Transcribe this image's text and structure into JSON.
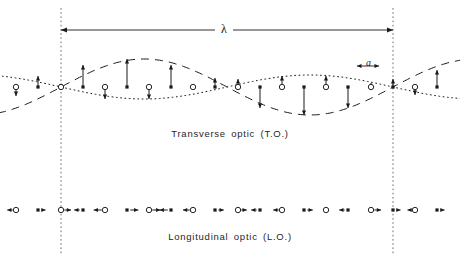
{
  "figure": {
    "title_top": "Transverse  optic  (T.O.)",
    "title_bottom": "Longitudinal  optic  (L.O.)",
    "wavelength_label": "λ",
    "lattice_label": "a",
    "colors": {
      "line": "#1a1a1a",
      "background": "#ffffff",
      "open_atom_stroke": "#1a1a1a",
      "filled_atom": "#1a1a1a"
    }
  },
  "chart_data": {
    "type": "line",
    "xlabel": "",
    "ylabel": "",
    "grid": false,
    "legend": "none",
    "annotations": [
      {
        "text": "λ",
        "meaning": "wavelength",
        "x_from": 61,
        "x_to": 393,
        "y": 30
      },
      {
        "text": "a",
        "meaning": "lattice spacing between like atoms",
        "x_from": 357,
        "x_to": 379,
        "y": 66
      },
      {
        "text": "Transverse  optic  (T.O.)",
        "y": 133
      },
      {
        "text": "Longitudinal  optic  (L.O.)",
        "y": 236
      }
    ],
    "axis_ranges": {
      "x": [
        0,
        460
      ],
      "y_transverse_baseline": 87,
      "y_longitudinal_baseline": 210
    },
    "wavelength_px": 332,
    "lattice_spacing_px": 22.1,
    "amplitude_px": 28,
    "series": [
      {
        "name": "dashed envelope (filled atoms, transverse)",
        "style": "dashed",
        "phase_deg": 0,
        "amplitude": 28,
        "description": "cos-like envelope traced by displaced filled atoms"
      },
      {
        "name": "dotted envelope (open atoms, transverse)",
        "style": "dotted",
        "phase_deg": 180,
        "amplitude": 12,
        "description": "anti-phase envelope traced by displaced open atoms"
      }
    ],
    "transverse_atoms": [
      {
        "x": 16,
        "type": "open",
        "disp": -9
      },
      {
        "x": 38,
        "type": "filled",
        "disp": 11
      },
      {
        "x": 61,
        "type": "open",
        "disp": -2
      },
      {
        "x": 83,
        "type": "filled",
        "disp": 22
      },
      {
        "x": 105,
        "type": "open",
        "disp": -12
      },
      {
        "x": 127,
        "type": "filled",
        "disp": 28
      },
      {
        "x": 149,
        "type": "open",
        "disp": -12
      },
      {
        "x": 171,
        "type": "filled",
        "disp": 22
      },
      {
        "x": 193,
        "type": "open",
        "disp": -3
      },
      {
        "x": 215,
        "type": "filled",
        "disp": 9
      },
      {
        "x": 238,
        "type": "open",
        "disp": 8
      },
      {
        "x": 260,
        "type": "filled",
        "disp": -21
      },
      {
        "x": 282,
        "type": "open",
        "disp": 11
      },
      {
        "x": 304,
        "type": "filled",
        "disp": -28
      },
      {
        "x": 326,
        "type": "open",
        "disp": 11
      },
      {
        "x": 348,
        "type": "filled",
        "disp": -21
      },
      {
        "x": 371,
        "type": "open",
        "disp": 4
      },
      {
        "x": 393,
        "type": "filled",
        "disp": 8
      },
      {
        "x": 415,
        "type": "open",
        "disp": -8
      },
      {
        "x": 437,
        "type": "filled",
        "disp": 17
      }
    ],
    "longitudinal_atoms": [
      {
        "x": 16,
        "type": "open",
        "disp": -7
      },
      {
        "x": 38,
        "type": "filled",
        "disp": 6
      },
      {
        "x": 61,
        "type": "open",
        "disp": 8
      },
      {
        "x": 83,
        "type": "filled",
        "disp": -7
      },
      {
        "x": 105,
        "type": "open",
        "disp": -9
      },
      {
        "x": 127,
        "type": "filled",
        "disp": 9
      },
      {
        "x": 149,
        "type": "open",
        "disp": 9
      },
      {
        "x": 171,
        "type": "filled",
        "disp": -9
      },
      {
        "x": 193,
        "type": "open",
        "disp": -8
      },
      {
        "x": 215,
        "type": "filled",
        "disp": 7
      },
      {
        "x": 238,
        "type": "open",
        "disp": 7
      },
      {
        "x": 260,
        "type": "filled",
        "disp": -7
      },
      {
        "x": 282,
        "type": "open",
        "disp": -7
      },
      {
        "x": 304,
        "type": "filled",
        "disp": 7
      },
      {
        "x": 326,
        "type": "open",
        "disp": 0
      },
      {
        "x": 348,
        "type": "filled",
        "disp": -7
      },
      {
        "x": 371,
        "type": "open",
        "disp": 8
      },
      {
        "x": 393,
        "type": "filled",
        "disp": 6
      },
      {
        "x": 415,
        "type": "open",
        "disp": -6
      },
      {
        "x": 437,
        "type": "filled",
        "disp": 6
      }
    ],
    "boundary_lines_x": [
      61,
      393
    ]
  }
}
